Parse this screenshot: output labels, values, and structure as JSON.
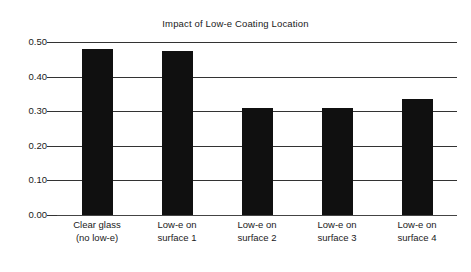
{
  "chart_data": {
    "type": "bar",
    "title": "Impact of Low-e Coating Location",
    "xlabel": "",
    "ylabel": "Center of Glass U-factor",
    "categories": [
      "Clear glass (no low-e)",
      "Low-e on surface 1",
      "Low-e on surface 2",
      "Low-e on surface 3",
      "Low-e on surface 4"
    ],
    "category_lines": [
      [
        "Clear glass",
        "(no low-e)"
      ],
      [
        "Low-e on",
        "surface 1"
      ],
      [
        "Low-e on",
        "surface 2"
      ],
      [
        "Low-e on",
        "surface 3"
      ],
      [
        "Low-e on",
        "surface 4"
      ]
    ],
    "values": [
      0.48,
      0.475,
      0.31,
      0.31,
      0.335
    ],
    "ylim": [
      0.0,
      0.5
    ],
    "yticks": [
      0.0,
      0.1,
      0.2,
      0.3,
      0.4,
      0.5
    ],
    "ytick_labels": [
      "0.00",
      "0.10",
      "0.20",
      "0.30",
      "0.40",
      "0.50"
    ],
    "grid": true,
    "grid_axis": "y",
    "legend": false,
    "bar_color": "#101010",
    "grid_color": "#333333",
    "text_color": "#1a1a1a",
    "background": "#ffffff"
  }
}
